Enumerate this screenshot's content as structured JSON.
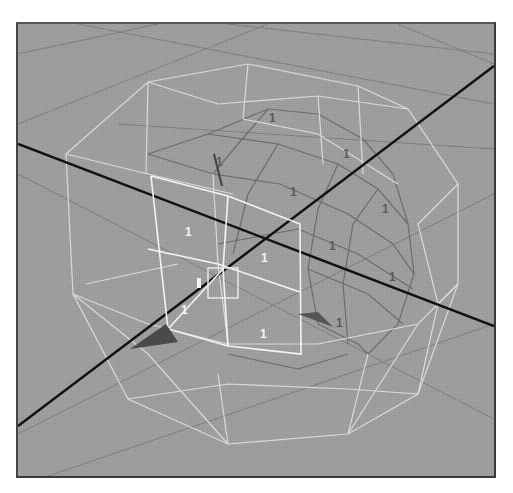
{
  "viewport": {
    "background": "#9c9c9c",
    "grid_color": "#7f7f7f",
    "axis_color": "#111111",
    "cage_color": "#e6e6e6",
    "selected_color": "#ffffff",
    "inner_color": "#6e6e6e"
  },
  "labels": {
    "front": [
      {
        "text": "1",
        "x": 167,
        "y": 212
      },
      {
        "text": "1",
        "x": 243,
        "y": 238
      },
      {
        "text": "1",
        "x": 163,
        "y": 290
      },
      {
        "text": "1",
        "x": 242,
        "y": 314
      }
    ],
    "back": [
      {
        "text": "1",
        "x": 251,
        "y": 98
      },
      {
        "text": "1",
        "x": 198,
        "y": 142
      },
      {
        "text": "1",
        "x": 325,
        "y": 134
      },
      {
        "text": "1",
        "x": 272,
        "y": 172
      },
      {
        "text": "1",
        "x": 364,
        "y": 189
      },
      {
        "text": "1",
        "x": 311,
        "y": 226
      },
      {
        "text": "1",
        "x": 371,
        "y": 257
      },
      {
        "text": "1",
        "x": 318,
        "y": 303
      }
    ]
  },
  "manipulator": {
    "center_box": {
      "x": 190,
      "y": 244,
      "w": 30,
      "h": 30
    }
  }
}
